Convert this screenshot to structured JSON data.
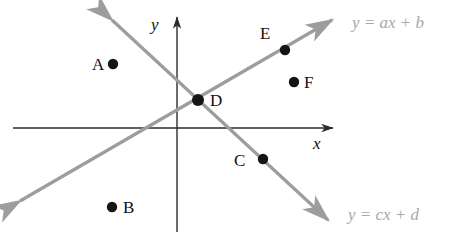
{
  "figure": {
    "background_color": "#ffffff",
    "axis_color": "#2b2b2b",
    "line_color": "#9d9d9d",
    "point_color": "#141414",
    "label_color": "#111111",
    "equation_label_color": "#a8a8a8"
  },
  "axes": {
    "x_label": "x",
    "y_label": "y",
    "origin": {
      "x": 177,
      "y": 128
    }
  },
  "lines": [
    {
      "id": "line-ascending",
      "equation": "y = ax + b",
      "equation_parts": {
        "y": "y",
        "eq": "=",
        "slope": "a",
        "var": "x",
        "plus": "+",
        "intercept": "b"
      },
      "direction": "increasing",
      "start": {
        "x": 18,
        "y": 203
      },
      "end": {
        "x": 334,
        "y": 18
      }
    },
    {
      "id": "line-descending",
      "equation": "y = cx + d",
      "equation_parts": {
        "y": "y",
        "eq": "=",
        "slope": "c",
        "var": "x",
        "plus": "+",
        "intercept": "d"
      },
      "direction": "decreasing",
      "start": {
        "x": 110,
        "y": 17
      },
      "end": {
        "x": 330,
        "y": 222
      }
    }
  ],
  "points": [
    {
      "label": "A",
      "dot": {
        "x": 113,
        "y": 64
      },
      "label_pos": {
        "x": 92,
        "y": 56
      },
      "on_line": "none"
    },
    {
      "label": "B",
      "dot": {
        "x": 112,
        "y": 207
      },
      "label_pos": {
        "x": 123,
        "y": 199
      },
      "on_line": "none"
    },
    {
      "label": "C",
      "dot": {
        "x": 263,
        "y": 159
      },
      "label_pos": {
        "x": 234,
        "y": 152
      },
      "on_line": "line-descending"
    },
    {
      "label": "D",
      "dot": {
        "x": 198,
        "y": 100
      },
      "label_pos": {
        "x": 210,
        "y": 92
      },
      "on_line": "both"
    },
    {
      "label": "E",
      "dot": {
        "x": 285,
        "y": 50
      },
      "label_pos": {
        "x": 260,
        "y": 25
      },
      "on_line": "line-ascending"
    },
    {
      "label": "F",
      "dot": {
        "x": 294,
        "y": 82
      },
      "label_pos": {
        "x": 304,
        "y": 74
      },
      "on_line": "none"
    }
  ],
  "equation_labels": [
    {
      "id": "eq-ascending",
      "text": "y = ax + b",
      "pos": {
        "x": 352,
        "y": 14
      }
    },
    {
      "id": "eq-descending",
      "text": "y = cx + d",
      "pos": {
        "x": 348,
        "y": 206
      }
    }
  ]
}
